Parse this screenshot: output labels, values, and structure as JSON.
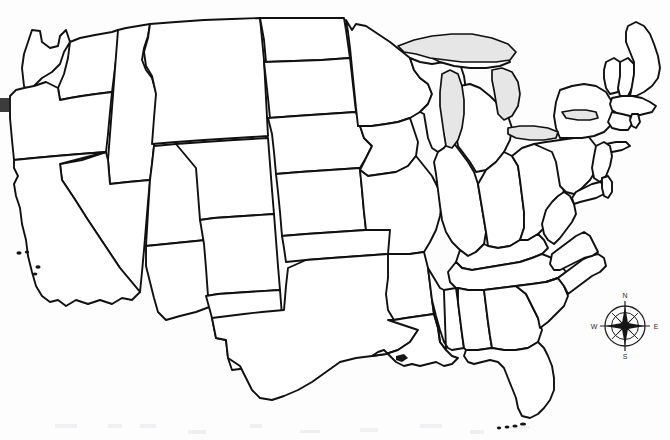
{
  "map": {
    "title": "United States blank political outline map",
    "region": "Contiguous United States",
    "projection_note": "48 contiguous states, state boundaries only, no labels",
    "colors": {
      "background": "#ffffff",
      "state_fill": "#ffffff",
      "border_stroke": "#101010",
      "lake_fill": "#e6e6e6",
      "compass_stroke": "#1e1e1e"
    },
    "states": [
      {
        "code": "WA",
        "name": "Washington"
      },
      {
        "code": "OR",
        "name": "Oregon"
      },
      {
        "code": "CA",
        "name": "California"
      },
      {
        "code": "NV",
        "name": "Nevada"
      },
      {
        "code": "ID",
        "name": "Idaho"
      },
      {
        "code": "MT",
        "name": "Montana"
      },
      {
        "code": "WY",
        "name": "Wyoming"
      },
      {
        "code": "UT",
        "name": "Utah"
      },
      {
        "code": "AZ",
        "name": "Arizona"
      },
      {
        "code": "CO",
        "name": "Colorado"
      },
      {
        "code": "NM",
        "name": "New Mexico"
      },
      {
        "code": "ND",
        "name": "North Dakota"
      },
      {
        "code": "SD",
        "name": "South Dakota"
      },
      {
        "code": "NE",
        "name": "Nebraska"
      },
      {
        "code": "KS",
        "name": "Kansas"
      },
      {
        "code": "OK",
        "name": "Oklahoma"
      },
      {
        "code": "TX",
        "name": "Texas"
      },
      {
        "code": "MN",
        "name": "Minnesota"
      },
      {
        "code": "IA",
        "name": "Iowa"
      },
      {
        "code": "MO",
        "name": "Missouri"
      },
      {
        "code": "AR",
        "name": "Arkansas"
      },
      {
        "code": "LA",
        "name": "Louisiana"
      },
      {
        "code": "WI",
        "name": "Wisconsin"
      },
      {
        "code": "IL",
        "name": "Illinois"
      },
      {
        "code": "MI",
        "name": "Michigan"
      },
      {
        "code": "IN",
        "name": "Indiana"
      },
      {
        "code": "OH",
        "name": "Ohio"
      },
      {
        "code": "KY",
        "name": "Kentucky"
      },
      {
        "code": "TN",
        "name": "Tennessee"
      },
      {
        "code": "MS",
        "name": "Mississippi"
      },
      {
        "code": "AL",
        "name": "Alabama"
      },
      {
        "code": "GA",
        "name": "Georgia"
      },
      {
        "code": "FL",
        "name": "Florida"
      },
      {
        "code": "SC",
        "name": "South Carolina"
      },
      {
        "code": "NC",
        "name": "North Carolina"
      },
      {
        "code": "VA",
        "name": "Virginia"
      },
      {
        "code": "WV",
        "name": "West Virginia"
      },
      {
        "code": "MD",
        "name": "Maryland"
      },
      {
        "code": "DE",
        "name": "Delaware"
      },
      {
        "code": "PA",
        "name": "Pennsylvania"
      },
      {
        "code": "NJ",
        "name": "New Jersey"
      },
      {
        "code": "NY",
        "name": "New York"
      },
      {
        "code": "CT",
        "name": "Connecticut"
      },
      {
        "code": "RI",
        "name": "Rhode Island"
      },
      {
        "code": "MA",
        "name": "Massachusetts"
      },
      {
        "code": "VT",
        "name": "Vermont"
      },
      {
        "code": "NH",
        "name": "New Hampshire"
      },
      {
        "code": "ME",
        "name": "Maine"
      }
    ],
    "water_bodies": [
      {
        "name": "Lake Superior"
      },
      {
        "name": "Lake Michigan"
      },
      {
        "name": "Lake Huron"
      },
      {
        "name": "Lake Erie"
      },
      {
        "name": "Lake Ontario"
      }
    ],
    "islands": [
      {
        "name": "Channel Islands"
      },
      {
        "name": "Florida Keys"
      },
      {
        "name": "Long Island"
      }
    ]
  },
  "compass": {
    "name": "compass-rose",
    "north": "N",
    "east": "E",
    "south": "S",
    "west": "W"
  }
}
